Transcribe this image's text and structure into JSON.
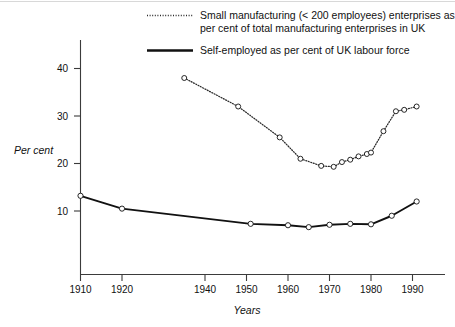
{
  "legend": {
    "position": "top",
    "entries": [
      {
        "key": "small-manufacturing",
        "style": "dotted",
        "marker": "open-circle",
        "line1": "Small manufacturing (< 200 employees) enterprises as",
        "line2": "per cent of total manufacturing enterprises in UK"
      },
      {
        "key": "self-employed",
        "style": "solid",
        "marker": "open-circle",
        "line1": "Self-employed as per cent of UK labour force",
        "line2": ""
      }
    ]
  },
  "axes": {
    "ylabel": "Per cent",
    "xlabel": "Years",
    "yticks": [
      "10",
      "20",
      "30",
      "40"
    ],
    "xticks": [
      "1910",
      "1920",
      "1940",
      "1950",
      "1960",
      "1970",
      "1980",
      "1990"
    ]
  },
  "colors": {
    "axis": "#3b3b3b",
    "solid_series": "#111111",
    "dotted_series": "#2a2a2a",
    "marker_fill": "#ffffff",
    "background": "#ffffff"
  },
  "chart_data": {
    "type": "line",
    "title": "",
    "subtitle": "",
    "xlabel": "Years",
    "ylabel": "Per cent",
    "xlim": [
      1908,
      1996
    ],
    "ylim": [
      0,
      44
    ],
    "grid": false,
    "legend_position": "top",
    "xticks": [
      1910,
      1920,
      1940,
      1950,
      1960,
      1970,
      1980,
      1990
    ],
    "yticks": [
      10,
      20,
      30,
      40
    ],
    "series": [
      {
        "name": "Small manufacturing (< 200 employees) enterprises as per cent of total manufacturing enterprises in UK",
        "style": "dotted",
        "marker": "open-circle",
        "x": [
          1935,
          1948,
          1958,
          1963,
          1968,
          1971,
          1973,
          1975,
          1977,
          1979,
          1980,
          1983,
          1986,
          1988,
          1991
        ],
        "y": [
          38.0,
          32.0,
          25.5,
          21.0,
          19.5,
          19.3,
          20.3,
          20.8,
          21.5,
          22.0,
          22.3,
          26.8,
          31.0,
          31.3,
          32.0
        ]
      },
      {
        "name": "Self-employed as per cent of UK labour force",
        "style": "solid",
        "marker": "open-circle",
        "x": [
          1910,
          1920,
          1951,
          1960,
          1965,
          1970,
          1975,
          1980,
          1985,
          1991
        ],
        "y": [
          13.2,
          10.5,
          7.3,
          7.0,
          6.6,
          7.1,
          7.3,
          7.2,
          9.0,
          12.0
        ]
      }
    ]
  }
}
